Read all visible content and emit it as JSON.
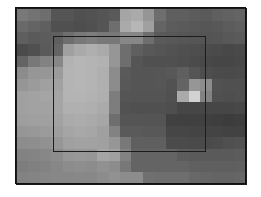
{
  "image": {
    "description": "Pixelated grayscale intensity map with an outlined region of interest",
    "grid": {
      "columns": 20,
      "rows": 15
    },
    "roi_rect": {
      "left": 53,
      "top": 36,
      "width": 153,
      "height": 116
    },
    "values": [
      [
        120,
        115,
        110,
        85,
        85,
        80,
        82,
        85,
        90,
        165,
        170,
        150,
        110,
        95,
        95,
        92,
        90,
        95,
        98,
        100
      ],
      [
        105,
        100,
        95,
        80,
        80,
        78,
        80,
        85,
        110,
        170,
        182,
        160,
        100,
        92,
        90,
        88,
        86,
        88,
        92,
        95
      ],
      [
        95,
        90,
        92,
        95,
        110,
        120,
        125,
        120,
        120,
        135,
        135,
        110,
        90,
        88,
        86,
        85,
        84,
        85,
        88,
        90
      ],
      [
        75,
        80,
        90,
        100,
        160,
        170,
        175,
        170,
        150,
        110,
        95,
        88,
        85,
        82,
        80,
        78,
        76,
        74,
        72,
        74
      ],
      [
        100,
        120,
        130,
        135,
        178,
        182,
        180,
        178,
        150,
        110,
        85,
        80,
        80,
        80,
        78,
        75,
        72,
        70,
        70,
        72
      ],
      [
        140,
        150,
        150,
        155,
        180,
        182,
        180,
        175,
        140,
        90,
        85,
        85,
        86,
        88,
        95,
        85,
        78,
        75,
        74,
        75
      ],
      [
        150,
        155,
        160,
        162,
        180,
        182,
        180,
        176,
        140,
        88,
        85,
        85,
        86,
        82,
        100,
        150,
        140,
        82,
        80,
        80
      ],
      [
        160,
        162,
        165,
        165,
        180,
        180,
        178,
        175,
        125,
        85,
        84,
        84,
        84,
        80,
        170,
        210,
        130,
        80,
        78,
        80
      ],
      [
        160,
        162,
        162,
        165,
        176,
        176,
        175,
        170,
        125,
        82,
        80,
        80,
        80,
        78,
        70,
        70,
        70,
        70,
        70,
        72
      ],
      [
        158,
        160,
        160,
        162,
        170,
        172,
        170,
        166,
        110,
        85,
        85,
        84,
        84,
        65,
        64,
        64,
        64,
        62,
        60,
        62
      ],
      [
        150,
        152,
        155,
        158,
        165,
        168,
        166,
        160,
        130,
        90,
        90,
        88,
        88,
        70,
        70,
        68,
        68,
        68,
        66,
        66
      ],
      [
        140,
        142,
        145,
        150,
        160,
        162,
        162,
        160,
        150,
        120,
        95,
        95,
        95,
        75,
        75,
        74,
        74,
        76,
        80,
        82
      ],
      [
        130,
        132,
        135,
        140,
        150,
        152,
        150,
        165,
        160,
        130,
        100,
        100,
        100,
        100,
        92,
        90,
        90,
        90,
        90,
        92
      ],
      [
        125,
        128,
        130,
        135,
        140,
        142,
        140,
        145,
        140,
        120,
        100,
        100,
        100,
        100,
        100,
        96,
        95,
        95,
        95,
        96
      ],
      [
        130,
        132,
        134,
        135,
        135,
        136,
        136,
        140,
        145,
        140,
        140,
        112,
        110,
        110,
        110,
        104,
        102,
        100,
        100,
        102
      ]
    ]
  }
}
